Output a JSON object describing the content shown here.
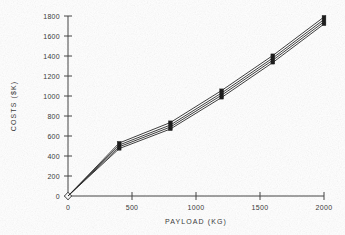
{
  "chart_data": {
    "type": "line",
    "title": "",
    "subtitle": "",
    "xlabel": "PAYLOAD (KG)",
    "ylabel": "COSTS ($K)",
    "xlim": [
      0,
      2000
    ],
    "ylim": [
      0,
      1800
    ],
    "xticks": [
      0,
      500,
      1000,
      1500,
      2000
    ],
    "yticks": [
      0,
      200,
      400,
      600,
      800,
      1000,
      1200,
      1400,
      1600,
      1800
    ],
    "xtick_labels": [
      "0",
      "500",
      "1000",
      "1500",
      "2000"
    ],
    "ytick_labels": [
      "0",
      "200",
      "400",
      "600",
      "800",
      "1000",
      "1200",
      "1400",
      "1600",
      "1800"
    ],
    "grid": false,
    "legend": "none",
    "x": [
      400,
      800,
      1200,
      1600,
      2000
    ],
    "series": [
      {
        "name": "series-1",
        "values": [
          530,
          735,
          1055,
          1405,
          1790
        ]
      },
      {
        "name": "series-2",
        "values": [
          510,
          710,
          1030,
          1380,
          1765
        ]
      },
      {
        "name": "series-3",
        "values": [
          492,
          690,
          1008,
          1358,
          1742
        ]
      },
      {
        "name": "series-4",
        "values": [
          474,
          670,
          985,
          1335,
          1720
        ]
      }
    ],
    "origin_marker": {
      "x": 0,
      "y": 0,
      "shape": "diamond"
    },
    "marker_shape": "filled-rectangle",
    "annotations": []
  },
  "axes": {
    "x_axis_name": "payload-axis",
    "y_axis_name": "costs-axis"
  }
}
